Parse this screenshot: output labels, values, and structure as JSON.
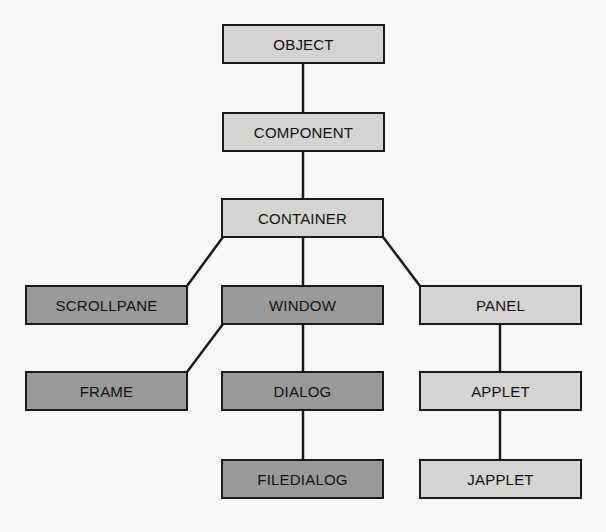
{
  "diagram": {
    "type": "class-hierarchy-tree",
    "colors": {
      "light_node": "#d4d4d2",
      "dark_node": "#9a9a98",
      "line": "#1a1a1a",
      "background": "#f7f7f5"
    },
    "nodes": [
      {
        "id": "object",
        "label": "OBJECT",
        "shade": "light"
      },
      {
        "id": "component",
        "label": "COMPONENT",
        "shade": "light"
      },
      {
        "id": "container",
        "label": "CONTAINER",
        "shade": "light"
      },
      {
        "id": "scrollpane",
        "label": "SCROLLPANE",
        "shade": "dark"
      },
      {
        "id": "window",
        "label": "WINDOW",
        "shade": "dark"
      },
      {
        "id": "panel",
        "label": "PANEL",
        "shade": "light"
      },
      {
        "id": "frame",
        "label": "FRAME",
        "shade": "dark"
      },
      {
        "id": "dialog",
        "label": "DIALOG",
        "shade": "dark"
      },
      {
        "id": "applet",
        "label": "APPLET",
        "shade": "light"
      },
      {
        "id": "filedialog",
        "label": "FILEDIALOG",
        "shade": "dark"
      },
      {
        "id": "japplet",
        "label": "JAPPLET",
        "shade": "light"
      }
    ],
    "edges": [
      [
        "OBJECT",
        "COMPONENT"
      ],
      [
        "COMPONENT",
        "CONTAINER"
      ],
      [
        "CONTAINER",
        "SCROLLPANE"
      ],
      [
        "CONTAINER",
        "WINDOW"
      ],
      [
        "CONTAINER",
        "PANEL"
      ],
      [
        "WINDOW",
        "FRAME"
      ],
      [
        "WINDOW",
        "DIALOG"
      ],
      [
        "DIALOG",
        "FILEDIALOG"
      ],
      [
        "PANEL",
        "APPLET"
      ],
      [
        "APPLET",
        "JAPPLET"
      ]
    ]
  }
}
